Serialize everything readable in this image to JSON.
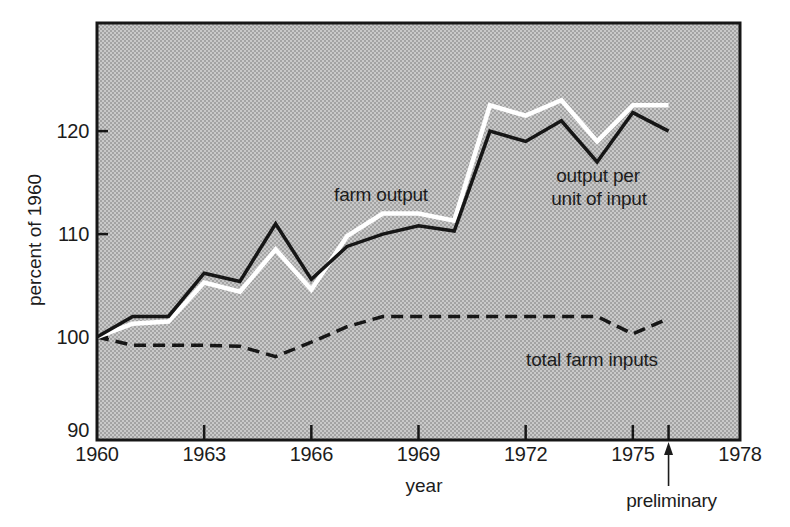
{
  "chart_data": {
    "type": "line",
    "title": "",
    "xlabel": "year",
    "ylabel": "percent of 1960",
    "xlim": [
      1960,
      1978
    ],
    "ylim": [
      90,
      130.5
    ],
    "grid": false,
    "legend": "inline-annotations",
    "x_tick_labels": [
      1960,
      1963,
      1966,
      1969,
      1972,
      1975,
      1978
    ],
    "x_tick_marks": [
      1963,
      1966,
      1969,
      1972,
      1975,
      1976
    ],
    "y_tick_labels": [
      90,
      100,
      110,
      120
    ],
    "y_tick_marks": [
      100,
      110,
      120
    ],
    "x": [
      1960,
      1961,
      1962,
      1963,
      1964,
      1965,
      1966,
      1967,
      1968,
      1969,
      1970,
      1971,
      1972,
      1973,
      1974,
      1975,
      1976
    ],
    "series": [
      {
        "name": "farm output",
        "color": "#ffffff",
        "line_style": "solid",
        "values": [
          100,
          101.3,
          101.5,
          105.3,
          104.4,
          108.5,
          104.6,
          109.8,
          112,
          112,
          111.3,
          122.5,
          121.5,
          123,
          119,
          122.5,
          122.5
        ]
      },
      {
        "name": "output per unit of input",
        "color": "#161616",
        "line_style": "solid",
        "values": [
          100,
          102,
          102,
          106.2,
          105.4,
          111,
          105.6,
          108.8,
          110,
          110.8,
          110.3,
          120,
          119,
          121,
          117,
          121.8,
          120
        ]
      },
      {
        "name": "total farm inputs",
        "color": "#161616",
        "line_style": "dashed",
        "values": [
          100,
          99.2,
          99.2,
          99.2,
          99.1,
          98.1,
          99.5,
          101,
          102,
          102,
          102,
          102,
          102,
          102,
          102,
          100.3,
          101.8
        ]
      }
    ],
    "annotations": {
      "farm_output": "farm output",
      "output_per_unit": [
        "output per",
        "unit of input"
      ],
      "total_farm_inputs": "total farm inputs",
      "preliminary": "preliminary",
      "preliminary_year": 1976
    },
    "colors": {
      "plot_background": "#b5b5b5",
      "halftone_dot": "#969696",
      "halftone_base": "#c9c9c9",
      "line_dark": "#161616",
      "line_white": "#ffffff",
      "text": "#1c1c1c",
      "page_background": "#ffffff"
    }
  }
}
